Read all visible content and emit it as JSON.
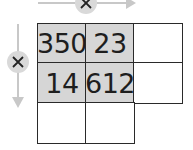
{
  "diagram": {
    "type": "multiplication-grid",
    "operator_symbol": "×",
    "top_arrow": {
      "symbol": "×",
      "direction": "right"
    },
    "left_arrow": {
      "symbol": "×",
      "direction": "down"
    },
    "colors": {
      "shaded": "#d6d6d6",
      "line": "#2a2a2a",
      "arrow": "#c8c8c8",
      "circle": "#d9d9d9"
    },
    "grid": {
      "rows": [
        [
          {
            "value": "350",
            "shaded": true
          },
          {
            "value": "23",
            "shaded": true
          },
          {
            "value": "",
            "shaded": false
          }
        ],
        [
          {
            "value": "14",
            "shaded": true
          },
          {
            "value": "612",
            "shaded": true
          },
          {
            "value": "",
            "shaded": false
          }
        ],
        [
          {
            "value": "",
            "shaded": false
          },
          {
            "value": "",
            "shaded": false
          }
        ]
      ]
    }
  }
}
